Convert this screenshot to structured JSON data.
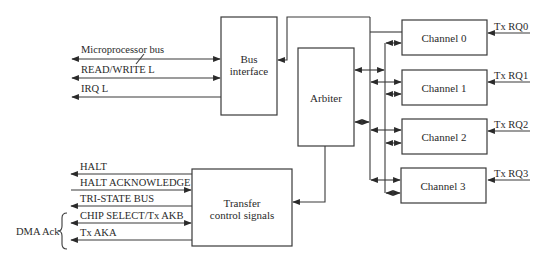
{
  "diagram": {
    "type": "dma-controller-block-diagram",
    "blocks": {
      "bus_interface": {
        "line1": "Bus",
        "line2": "interface"
      },
      "arbiter": {
        "label": "Arbiter"
      },
      "transfer": {
        "line1": "Transfer",
        "line2": "control signals"
      },
      "channels": [
        {
          "label": "Channel 0",
          "request": "Tx RQ0"
        },
        {
          "label": "Channel 1",
          "request": "Tx RQ1"
        },
        {
          "label": "Channel 2",
          "request": "Tx RQ2"
        },
        {
          "label": "Channel 3",
          "request": "Tx RQ3"
        }
      ]
    },
    "bus_signals": [
      {
        "label": "Microprocessor bus",
        "direction": "bidirectional"
      },
      {
        "label": "READ/WRITE L",
        "direction": "bidirectional"
      },
      {
        "label": "IRQ L",
        "direction": "out"
      }
    ],
    "transfer_signals": [
      {
        "label": "HALT",
        "direction": "out"
      },
      {
        "label": "HALT ACKNOWLEDGE",
        "direction": "in"
      },
      {
        "label": "TRI-STATE BUS",
        "direction": "out"
      },
      {
        "label": "CHIP SELECT/Tx AKB",
        "direction": "bidirectional"
      },
      {
        "label": "Tx AKA",
        "direction": "out"
      }
    ],
    "group_label": "DMA Ack",
    "colors": {
      "line": "#3a3a3a",
      "text": "#2a2a2a",
      "background": "#ffffff"
    }
  }
}
